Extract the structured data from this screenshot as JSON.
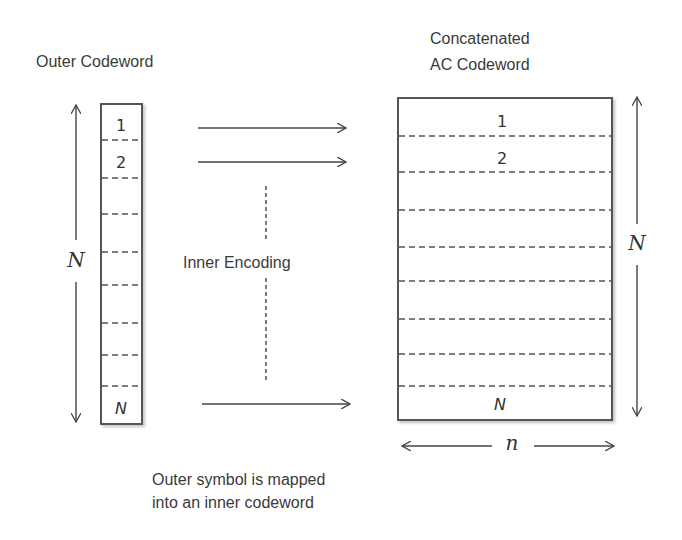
{
  "labels": {
    "outer_codeword": "Outer Codeword",
    "concatenated_line1": "Concatenated",
    "concatenated_line2": "AC Codeword",
    "inner_encoding": "Inner Encoding",
    "caption_line1": "Outer symbol is mapped",
    "caption_line2": "into an inner codeword"
  },
  "outer_box": {
    "symbols": [
      "1",
      "2",
      "N"
    ],
    "num_slots": 9,
    "length_label": "N"
  },
  "concatenated_box": {
    "symbols": [
      "1",
      "2",
      "N"
    ],
    "num_slots": 9,
    "height_label": "N",
    "width_label": "n"
  },
  "colors": {
    "line": "#444444",
    "dash": "#555555",
    "text": "#3a3a3a"
  }
}
